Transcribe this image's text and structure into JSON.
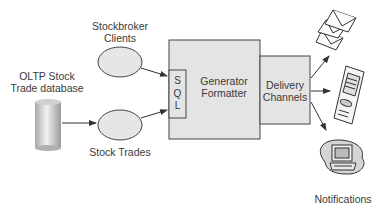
{
  "diagram": {
    "nodes": {
      "oltp_db": {
        "label_line1": "OLTP Stock",
        "label_line2": "Trade database",
        "shape": "cylinder"
      },
      "stockbroker_clients": {
        "label_line1": "Stockbroker",
        "label_line2": "Clients",
        "shape": "ellipse"
      },
      "stock_trades": {
        "label": "Stock Trades",
        "shape": "ellipse"
      },
      "generator_formatter": {
        "label_line1": "Generator",
        "label_line2": "Formatter",
        "shape": "box"
      },
      "sql": {
        "letters": [
          "S",
          "Q",
          "L"
        ],
        "shape": "box"
      },
      "delivery_channels": {
        "label_line1": "Delivery",
        "label_line2": "Channels",
        "shape": "box"
      },
      "email": {
        "icon": "envelope-icon"
      },
      "mobile": {
        "icon": "mobile-phone-icon"
      },
      "notifications": {
        "label": "Notifications",
        "icon": "computer-icon"
      }
    },
    "edges": [
      {
        "from": "oltp_db",
        "to": "stock_trades"
      },
      {
        "from": "stockbroker_clients",
        "to": "sql"
      },
      {
        "from": "stock_trades",
        "to": "sql"
      },
      {
        "from": "delivery_channels",
        "to": "email"
      },
      {
        "from": "delivery_channels",
        "to": "mobile"
      },
      {
        "from": "delivery_channels",
        "to": "notifications"
      }
    ],
    "colors": {
      "box_fill": "#e4e4e4",
      "stroke": "#444444",
      "ellipse_fill": "#e6e6e6"
    }
  }
}
